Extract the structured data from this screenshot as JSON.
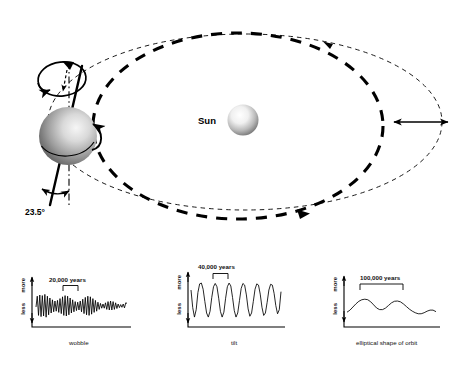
{
  "figure": {
    "title_present": false,
    "background_color": "#ffffff",
    "ink_color": "#000000"
  },
  "orbit_diagram": {
    "sun_label": "Sun",
    "tilt_label": "23.5°",
    "sun_color_center": "#ffffff",
    "sun_color_edge": "#6f6f6f",
    "earth_color_center": "#f2f2f2",
    "earth_color_edge": "#555555",
    "orbits": [
      {
        "name": "thin-eccentric-orbit",
        "style": "thin-dashed",
        "meaning": "more elliptical orbit"
      },
      {
        "name": "thick-circular-orbit",
        "style": "thick-dashed",
        "meaning": "more circular orbit"
      }
    ],
    "eccentricity_arrow": {
      "name": "eccentricity-double-arrow",
      "double_headed": true
    },
    "earth_features": [
      "rotation-axis",
      "precession-wobble-loop",
      "rotation-direction-arrow",
      "equator-line",
      "vertical-reference-line"
    ]
  },
  "charts": [
    {
      "id": "wobble",
      "caption": "wobble",
      "period_label": "20,000 years",
      "y_axis_top": "more",
      "y_axis_bottom": "less",
      "chart_data": {
        "type": "line",
        "title": "wobble",
        "xlabel": "",
        "ylabel": "",
        "ylim": [
          0,
          1
        ],
        "grid": false,
        "legend": "none",
        "period_years": 20000,
        "annotation": "20,000 years",
        "description": "High-frequency oscillation with amplitude modulation; amplitude decreases toward the right",
        "x": [
          0,
          1,
          2,
          3,
          4,
          5,
          6,
          7,
          8,
          9,
          10,
          11,
          12,
          13,
          14,
          15,
          16,
          17,
          18,
          19,
          20,
          21,
          22,
          23,
          24,
          25,
          26,
          27,
          28,
          29,
          30,
          31,
          32,
          33,
          34,
          35,
          36,
          37,
          38,
          39,
          40,
          41,
          42,
          43,
          44,
          45,
          46,
          47,
          48,
          49,
          50,
          51,
          52,
          53,
          54,
          55,
          56,
          57,
          58,
          59,
          60,
          61,
          62,
          63,
          64,
          65,
          66,
          67,
          68,
          69,
          70,
          71,
          72
        ],
        "values": [
          0.5,
          0.86,
          0.22,
          0.9,
          0.18,
          0.88,
          0.2,
          0.92,
          0.16,
          0.86,
          0.24,
          0.8,
          0.3,
          0.74,
          0.34,
          0.7,
          0.36,
          0.72,
          0.32,
          0.78,
          0.28,
          0.84,
          0.22,
          0.88,
          0.2,
          0.86,
          0.24,
          0.8,
          0.3,
          0.74,
          0.34,
          0.68,
          0.38,
          0.66,
          0.4,
          0.7,
          0.34,
          0.76,
          0.28,
          0.82,
          0.24,
          0.86,
          0.22,
          0.84,
          0.26,
          0.78,
          0.32,
          0.72,
          0.36,
          0.66,
          0.42,
          0.62,
          0.46,
          0.6,
          0.46,
          0.64,
          0.42,
          0.68,
          0.4,
          0.7,
          0.4,
          0.68,
          0.42,
          0.64,
          0.45,
          0.6,
          0.48,
          0.58,
          0.49,
          0.6,
          0.47,
          0.64,
          0.62
        ]
      }
    },
    {
      "id": "tilt",
      "caption": "tilt",
      "period_label": "40,000 years",
      "y_axis_top": "more",
      "y_axis_bottom": "less",
      "chart_data": {
        "type": "line",
        "title": "tilt",
        "xlabel": "",
        "ylabel": "",
        "ylim": [
          0,
          1
        ],
        "grid": false,
        "legend": "none",
        "period_years": 40000,
        "annotation": "40,000 years",
        "description": "Regular sinusoidal oscillation of roughly constant amplitude, about 6.5 cycles shown",
        "x": [
          0,
          1,
          2,
          3,
          4,
          5,
          6,
          7,
          8,
          9,
          10,
          11,
          12,
          13,
          14,
          15,
          16,
          17,
          18,
          19,
          20,
          21,
          22,
          23,
          24,
          25,
          26,
          27,
          28,
          29,
          30,
          31,
          32,
          33,
          34,
          35,
          36,
          37,
          38,
          39,
          40,
          41,
          42,
          43,
          44,
          45,
          46,
          47,
          48,
          49,
          50,
          51,
          52
        ],
        "values": [
          0.78,
          0.35,
          0.12,
          0.3,
          0.72,
          0.93,
          0.95,
          0.8,
          0.5,
          0.22,
          0.12,
          0.26,
          0.6,
          0.86,
          0.94,
          0.86,
          0.58,
          0.26,
          0.12,
          0.24,
          0.58,
          0.86,
          0.95,
          0.88,
          0.6,
          0.28,
          0.12,
          0.22,
          0.52,
          0.82,
          0.94,
          0.9,
          0.66,
          0.32,
          0.14,
          0.22,
          0.5,
          0.8,
          0.93,
          0.9,
          0.68,
          0.36,
          0.16,
          0.22,
          0.48,
          0.78,
          0.92,
          0.9,
          0.7,
          0.4,
          0.2,
          0.3,
          0.74
        ]
      }
    },
    {
      "id": "elliptical-shape-of-orbit",
      "caption": "elliptical shape of orbit",
      "period_label": "100,000 years",
      "y_axis_top": "more",
      "y_axis_bottom": "less",
      "chart_data": {
        "type": "line",
        "title": "elliptical shape of orbit",
        "xlabel": "",
        "ylabel": "",
        "ylim": [
          0,
          1
        ],
        "grid": false,
        "legend": "none",
        "period_years": 100000,
        "annotation": "100,000 years",
        "description": "Slow long-wavelength undulation with about three broad peaks of decreasing height",
        "x": [
          0,
          1,
          2,
          3,
          4,
          5,
          6,
          7,
          8,
          9,
          10,
          11,
          12,
          13,
          14,
          15,
          16,
          17,
          18,
          19,
          20,
          21,
          22,
          23,
          24,
          25,
          26,
          27,
          28,
          29,
          30
        ],
        "values": [
          0.3,
          0.38,
          0.5,
          0.62,
          0.72,
          0.78,
          0.8,
          0.78,
          0.7,
          0.58,
          0.46,
          0.4,
          0.4,
          0.46,
          0.56,
          0.66,
          0.72,
          0.73,
          0.7,
          0.62,
          0.52,
          0.42,
          0.34,
          0.28,
          0.24,
          0.24,
          0.28,
          0.34,
          0.38,
          0.38,
          0.32
        ]
      }
    }
  ]
}
